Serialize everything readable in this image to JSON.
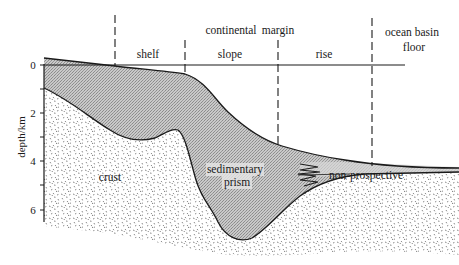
{
  "diagram": {
    "axis": {
      "label": "depth/km",
      "ticks": [
        "0",
        "2",
        "4",
        "6"
      ]
    },
    "zones": {
      "shelf": "shelf",
      "continental": "continental",
      "slope": "slope",
      "margin": "margin",
      "rise": "rise",
      "ocean_basin": "ocean basin",
      "floor": "floor"
    },
    "regions": {
      "crust": "crust",
      "sedimentary_line1": "sedimentary",
      "sedimentary_line2": "prism",
      "non_prospective": "non-prospective"
    },
    "colors": {
      "sediment_fill": "#bdbdbd",
      "crust_speckle": "#6e6e6e",
      "line": "#1a1a1a"
    }
  }
}
